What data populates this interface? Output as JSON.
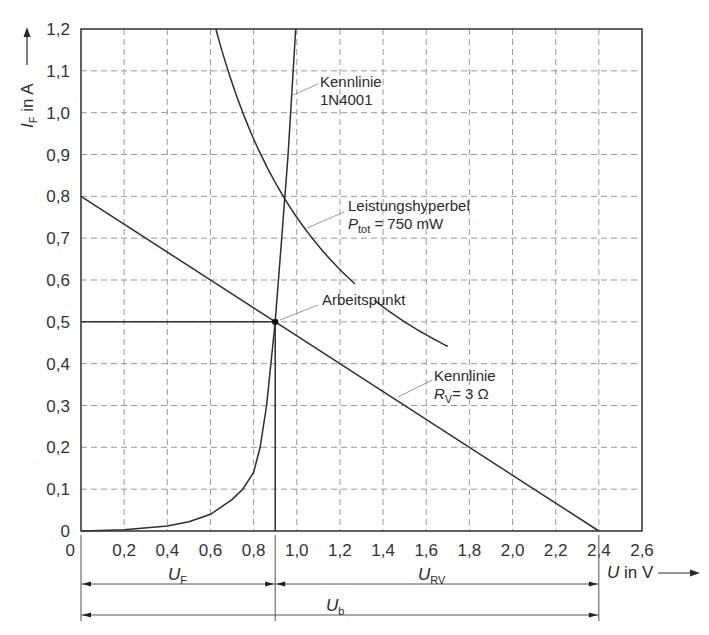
{
  "chart_data": {
    "type": "line",
    "title": "",
    "xlabel": {
      "symbol": "U",
      "unit_text": " in V"
    },
    "ylabel": {
      "symbol": "I",
      "subscript": "F",
      "unit_text": " in A"
    },
    "xlim": [
      0,
      2.6
    ],
    "ylim": [
      0,
      1.2
    ],
    "grid": true,
    "x_ticks": [
      "0",
      "0,2",
      "0,4",
      "0,6",
      "0,8",
      "1,0",
      "1,2",
      "1,4",
      "1,6",
      "1,8",
      "2,0",
      "2,2",
      "2,4",
      "2,6"
    ],
    "x_tick_values": [
      0,
      0.2,
      0.4,
      0.6,
      0.8,
      1.0,
      1.2,
      1.4,
      1.6,
      1.8,
      2.0,
      2.2,
      2.4,
      2.6
    ],
    "y_ticks": [
      "0",
      "0,1",
      "0,2",
      "0,3",
      "0,4",
      "0,5",
      "0,6",
      "0,7",
      "0,8",
      "0,9",
      "1,0",
      "1,1",
      "1,2"
    ],
    "y_tick_values": [
      0,
      0.1,
      0.2,
      0.3,
      0.4,
      0.5,
      0.6,
      0.7,
      0.8,
      0.9,
      1.0,
      1.1,
      1.2
    ],
    "series": [
      {
        "name": "Kennlinie 1N4001",
        "label_lines": [
          "Kennlinie",
          "1N4001"
        ],
        "x": [
          0.0,
          0.2,
          0.4,
          0.5,
          0.6,
          0.7,
          0.75,
          0.8,
          0.83,
          0.86,
          0.88,
          0.9,
          0.93,
          0.96,
          0.995
        ],
        "y": [
          0.0,
          0.003,
          0.012,
          0.022,
          0.04,
          0.075,
          0.1,
          0.14,
          0.2,
          0.3,
          0.4,
          0.5,
          0.7,
          0.9,
          1.2
        ]
      },
      {
        "name": "Leistungshyperbel Ptot = 750 mW",
        "label_line1": "Leistungshyperbel",
        "label_symbol": "P",
        "label_subscript": "tot",
        "label_rest": " = 750 mW",
        "power_W": 0.75,
        "x_range": [
          0.625,
          1.7
        ],
        "gap_x": [
          1.27,
          1.36
        ]
      },
      {
        "name": "Kennlinie RV = 3 Ω",
        "label_line1": "Kennlinie",
        "label_symbol": "R",
        "label_subscript": "V",
        "label_rest": "= 3 Ω",
        "x": [
          0,
          2.4
        ],
        "y": [
          0.8,
          0
        ]
      }
    ],
    "operating_point": {
      "label": "Arbeitspunkt",
      "x": 0.9,
      "y": 0.5
    },
    "dimensions": [
      {
        "symbol": "U",
        "subscript": "F",
        "from": 0,
        "to": 0.9
      },
      {
        "symbol": "U",
        "subscript": "RV",
        "from": 0.9,
        "to": 2.4
      },
      {
        "symbol": "U",
        "subscript": "b",
        "from": 0,
        "to": 2.4
      }
    ]
  }
}
